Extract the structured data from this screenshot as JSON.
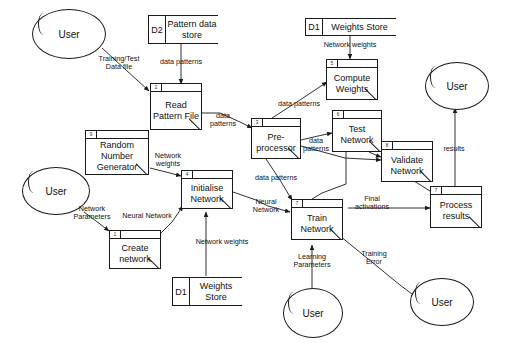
{
  "diagram": {
    "type": "data-flow-diagram"
  },
  "entities": [
    {
      "id": "user-top-left",
      "label": "User"
    },
    {
      "id": "user-mid-left",
      "label": "User"
    },
    {
      "id": "user-right",
      "label": "User"
    },
    {
      "id": "user-bottom-mid",
      "label": "User"
    },
    {
      "id": "user-bottom-right",
      "label": "User"
    }
  ],
  "data_stores": [
    {
      "id": "d2-pattern",
      "ref": "D2",
      "name": "Pattern\ndata store"
    },
    {
      "id": "d1-weights-top",
      "ref": "D1",
      "name": "Weights Store"
    },
    {
      "id": "d1-weights-bottom",
      "ref": "D1",
      "name": "Weights\nStore"
    }
  ],
  "processes": [
    {
      "id": "create-network",
      "num": "1",
      "label": "Create\nnetwork"
    },
    {
      "id": "read-pattern-file",
      "num": "2",
      "label": "Read\nPattern\nFile"
    },
    {
      "id": "pre-processor",
      "num": "3",
      "label": "Pre-\nprocessor"
    },
    {
      "id": "initialise-network",
      "num": "4",
      "label": "Initialise\nNetwork"
    },
    {
      "id": "compute-weights",
      "num": "5",
      "label": "Compute\nWeights"
    },
    {
      "id": "test-network",
      "num": "6",
      "label": "Test\nNetwork"
    },
    {
      "id": "validate-network",
      "num": "8",
      "label": "Validate\nNetwork"
    },
    {
      "id": "process-results",
      "num": "7",
      "label": "Process\nresults"
    },
    {
      "id": "train-network",
      "num": "7",
      "label": "Train\nNetwork"
    },
    {
      "id": "random-number-generator",
      "num": "9",
      "label": "Random\nNumber\nGenerator"
    }
  ],
  "flows": [
    {
      "id": "training-test-data-file",
      "label": "Training/Test\nData file"
    },
    {
      "id": "data-patterns-store-to-read",
      "label": "data patterns"
    },
    {
      "id": "data-patterns-read-to-pre",
      "label": "data\npatterns"
    },
    {
      "id": "data-patterns-pre-to-compute",
      "label": "data patterns"
    },
    {
      "id": "data-patterns-pre-to-test",
      "label": "data\npatterns"
    },
    {
      "id": "data-patterns-pre-to-train",
      "label": "data patterns"
    },
    {
      "id": "network-weights-store-to-compute",
      "label": "Network weights"
    },
    {
      "id": "network-weights-rng-to-init",
      "label": "Network\nweights"
    },
    {
      "id": "network-weights-store-to-init",
      "label": "Network weights"
    },
    {
      "id": "network-parameters",
      "label": "Network\nParameters"
    },
    {
      "id": "neural-network-create-to-init",
      "label": "Neural Network"
    },
    {
      "id": "neural-network-init-to-train",
      "label": "Neural\nNetwork"
    },
    {
      "id": "final-activations",
      "label": "Final\nactivations"
    },
    {
      "id": "learning-parameters",
      "label": "Learning\nParameters"
    },
    {
      "id": "training-error",
      "label": "Training\nError"
    },
    {
      "id": "results",
      "label": "results"
    }
  ],
  "colors": {
    "stroke": "#1a1a1a",
    "text": "#111111",
    "background": "#ffffff"
  }
}
